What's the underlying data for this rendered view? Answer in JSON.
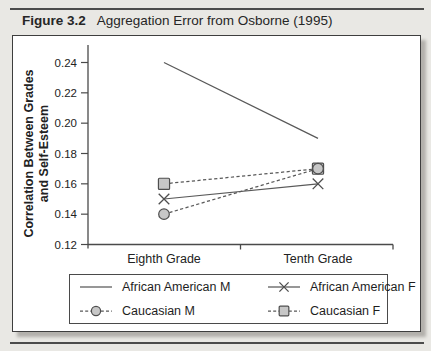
{
  "figure": {
    "label": "Figure 3.2",
    "title": "Aggregation Error from Osborne (1995)"
  },
  "chart_data": {
    "type": "line",
    "categories": [
      "Eighth Grade",
      "Tenth Grade"
    ],
    "series": [
      {
        "name": "African American M",
        "values": [
          0.24,
          0.19
        ],
        "line": "solid",
        "marker": "none"
      },
      {
        "name": "African American F",
        "values": [
          0.15,
          0.16
        ],
        "line": "solid",
        "marker": "x"
      },
      {
        "name": "Caucasian M",
        "values": [
          0.14,
          0.17
        ],
        "line": "dashed",
        "marker": "circle"
      },
      {
        "name": "Caucasian F",
        "values": [
          0.16,
          0.17
        ],
        "line": "dashed",
        "marker": "square"
      }
    ],
    "ylabel": "Correlation Between Grades and Self-Esteem",
    "ylabel_lines": [
      "Correlation Between Grades",
      "and Self-Esteem"
    ],
    "xlabel": "",
    "ylim": [
      0.12,
      0.24
    ],
    "yticks": [
      0.24,
      0.22,
      0.2,
      0.18,
      0.16,
      0.14,
      0.12
    ],
    "ytick_labels": [
      "0.24",
      "0.22",
      "0.20",
      "0.18",
      "0.16",
      "0.14",
      "0.12"
    ],
    "grid": false,
    "legend_position": "bottom",
    "colors": {
      "line": "#595959",
      "marker_fill": "#c7c7c7",
      "marker_stroke": "#4e4e4e",
      "text": "#222222"
    }
  },
  "style": {
    "page_bg": "#e9e8e4",
    "rule": "#4c4c4c",
    "panel_border": "#3e3e3e",
    "panel_shadow": "#b3b1ac"
  }
}
